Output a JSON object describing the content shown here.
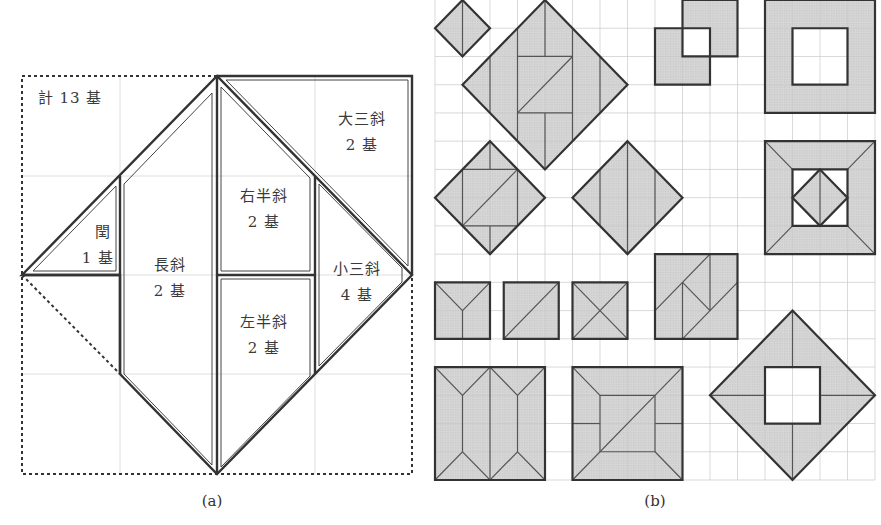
{
  "figure_a": {
    "caption": "(a)",
    "total_label": "計 13 基",
    "pieces": [
      {
        "name": "大三斜",
        "count": "2 基"
      },
      {
        "name": "右半斜",
        "count": "2 基"
      },
      {
        "name": "閏",
        "count": "1 基"
      },
      {
        "name": "長斜",
        "count": "2 基"
      },
      {
        "name": "小三斜",
        "count": "4 基"
      },
      {
        "name": "左半斜",
        "count": "2 基"
      }
    ]
  },
  "figure_b": {
    "caption": "(b)",
    "grid": {
      "cols": 16,
      "rows": 17
    },
    "shapes": [
      {
        "type": "diamond",
        "center": [
          1,
          1
        ],
        "radius": 1
      },
      {
        "type": "diamond",
        "center": [
          4,
          3
        ],
        "radius": 3
      },
      {
        "type": "overlapping-squares",
        "squares": [
          [
            9,
            0,
            11,
            2
          ],
          [
            8,
            1,
            10,
            3
          ]
        ],
        "hole": [
          9,
          1,
          10,
          2
        ]
      },
      {
        "type": "hollow-square",
        "outer": [
          12,
          0,
          16,
          4
        ],
        "inner": [
          13,
          1,
          15,
          3
        ]
      },
      {
        "type": "diamond",
        "center": [
          2,
          7
        ],
        "radius": 2
      },
      {
        "type": "diamond",
        "center": [
          7,
          7
        ],
        "radius": 2
      },
      {
        "type": "framed-square-with-diamond",
        "outer": [
          12,
          5,
          16,
          9
        ],
        "inner": [
          13,
          6,
          15,
          8
        ]
      },
      {
        "type": "square-y",
        "rect": [
          0,
          10,
          2,
          12
        ]
      },
      {
        "type": "square-diagonal",
        "rect": [
          2.5,
          10,
          4.5,
          12
        ]
      },
      {
        "type": "square-x",
        "rect": [
          5,
          10,
          7,
          12
        ]
      },
      {
        "type": "rect-composite",
        "rect": [
          8,
          9,
          11,
          12
        ]
      },
      {
        "type": "rect-double-hip",
        "rect": [
          0,
          13,
          4,
          17
        ]
      },
      {
        "type": "square-hip",
        "rect": [
          5,
          13,
          9,
          17
        ]
      },
      {
        "type": "diamond-hollow",
        "center": [
          13,
          14
        ],
        "radius": 3,
        "hole": [
          12,
          13,
          14,
          15
        ]
      }
    ]
  },
  "colors": {
    "outline": "#333333",
    "fill": "#d3d3d3",
    "grid": "#cfcfcf",
    "grid_inside": "#a9a9a9"
  }
}
